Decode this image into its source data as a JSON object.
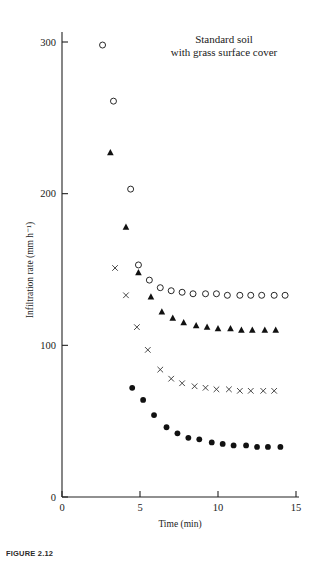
{
  "figure": {
    "caption": "FIGURE 2.12",
    "annotation_line1": "Standard soil",
    "annotation_line2": "with grass surface cover"
  },
  "chart_data": {
    "type": "scatter",
    "title": "Standard soil with grass surface cover",
    "xlabel": "Time (min)",
    "ylabel": "Infiltration rate (mm h⁻¹)",
    "xlim": [
      0,
      15
    ],
    "ylim": [
      0,
      310
    ],
    "xticks": [
      0,
      5,
      10,
      15
    ],
    "yticks": [
      0,
      100,
      200,
      300
    ],
    "xtick_labels": [
      "0",
      "5",
      "10",
      "15"
    ],
    "ytick_labels": [
      "0",
      "100",
      "200",
      "300"
    ],
    "grid": false,
    "legend": "none",
    "series": [
      {
        "name": "open-circle",
        "marker": "open-circle",
        "x": [
          2.6,
          3.3,
          4.4,
          4.9,
          5.6,
          6.3,
          7.0,
          7.7,
          8.4,
          9.2,
          9.9,
          10.6,
          11.4,
          12.1,
          12.8,
          13.6,
          14.3
        ],
        "y": [
          298,
          261,
          203,
          153,
          143,
          138,
          136,
          135,
          134,
          134,
          134,
          133,
          133,
          133,
          133,
          133,
          133
        ]
      },
      {
        "name": "filled-triangle",
        "marker": "filled-triangle",
        "x": [
          3.1,
          4.1,
          4.9,
          5.7,
          6.4,
          7.1,
          7.8,
          8.6,
          9.3,
          10.0,
          10.8,
          11.5,
          12.2,
          13.0,
          13.7
        ],
        "y": [
          227,
          178,
          148,
          132,
          122,
          118,
          115,
          113,
          112,
          111,
          111,
          110,
          110,
          110,
          110
        ]
      },
      {
        "name": "cross",
        "marker": "cross",
        "x": [
          3.4,
          4.1,
          4.8,
          5.5,
          6.3,
          7.0,
          7.7,
          8.5,
          9.2,
          9.9,
          10.7,
          11.4,
          12.1,
          12.9,
          13.6
        ],
        "y": [
          151,
          133,
          112,
          97,
          84,
          78,
          75,
          73,
          72,
          71,
          71,
          70,
          70,
          70,
          70
        ]
      },
      {
        "name": "filled-circle",
        "marker": "filled-circle",
        "x": [
          4.5,
          5.2,
          5.9,
          6.7,
          7.4,
          8.1,
          8.8,
          9.6,
          10.3,
          11.0,
          11.8,
          12.5,
          13.2,
          14.0
        ],
        "y": [
          72,
          64,
          54,
          46,
          42,
          39,
          38,
          36,
          35,
          34,
          34,
          33,
          33,
          33
        ]
      }
    ]
  }
}
